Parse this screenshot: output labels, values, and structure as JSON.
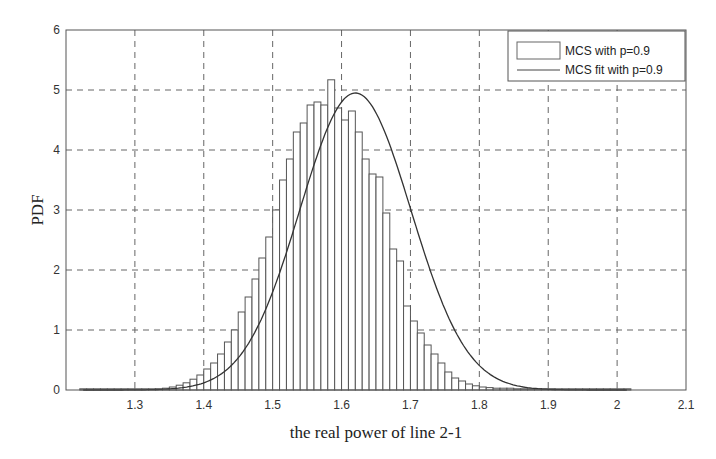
{
  "chart_data": {
    "type": "bar",
    "subtype": "histogram_with_fit",
    "title": "",
    "xlabel": "the real power of line 2-1",
    "ylabel": "PDF",
    "xlim": [
      1.2,
      2.1
    ],
    "ylim": [
      0,
      6
    ],
    "xticks": [
      "1.3",
      "1.4",
      "1.5",
      "1.6",
      "1.7",
      "1.8",
      "1.9",
      "2",
      "2.1"
    ],
    "xtick_values": [
      1.3,
      1.4,
      1.5,
      1.6,
      1.7,
      1.8,
      1.9,
      2.0,
      2.1
    ],
    "yticks": [
      "0",
      "1",
      "2",
      "3",
      "4",
      "5",
      "6"
    ],
    "ytick_values": [
      0,
      1,
      2,
      3,
      4,
      5,
      6
    ],
    "grid": true,
    "grid_style": "dashed",
    "legend_position": "upper right",
    "bin_width": 0.01,
    "series": [
      {
        "name": "MCS with p=0.9",
        "kind": "histogram",
        "bin_centers": [
          1.225,
          1.235,
          1.245,
          1.255,
          1.265,
          1.275,
          1.285,
          1.295,
          1.305,
          1.315,
          1.325,
          1.335,
          1.345,
          1.355,
          1.365,
          1.375,
          1.385,
          1.395,
          1.405,
          1.415,
          1.425,
          1.435,
          1.445,
          1.455,
          1.465,
          1.475,
          1.485,
          1.495,
          1.505,
          1.515,
          1.525,
          1.535,
          1.545,
          1.555,
          1.565,
          1.575,
          1.585,
          1.595,
          1.605,
          1.615,
          1.625,
          1.635,
          1.645,
          1.655,
          1.665,
          1.675,
          1.685,
          1.695,
          1.705,
          1.715,
          1.725,
          1.735,
          1.745,
          1.755,
          1.765,
          1.775,
          1.785,
          1.795,
          1.805,
          1.815,
          1.825,
          1.835,
          1.845,
          1.855,
          1.865,
          1.875,
          1.885,
          1.895,
          1.905,
          1.915,
          1.925,
          1.935,
          1.945,
          1.955,
          1.965,
          1.975,
          1.985,
          1.995,
          2.005,
          2.015
        ],
        "values": [
          0.02,
          0.02,
          0.02,
          0.02,
          0.02,
          0.02,
          0.02,
          0.02,
          0.02,
          0.02,
          0.02,
          0.02,
          0.03,
          0.05,
          0.08,
          0.12,
          0.18,
          0.25,
          0.35,
          0.45,
          0.6,
          0.8,
          1.0,
          1.3,
          1.55,
          1.85,
          2.2,
          2.55,
          3.0,
          3.5,
          3.85,
          4.3,
          4.45,
          4.75,
          4.8,
          4.75,
          5.17,
          4.7,
          4.5,
          4.65,
          4.3,
          3.85,
          3.6,
          3.55,
          2.95,
          2.35,
          2.15,
          1.4,
          1.15,
          0.95,
          0.75,
          0.6,
          0.45,
          0.3,
          0.2,
          0.15,
          0.1,
          0.07,
          0.05,
          0.04,
          0.03,
          0.03,
          0.03,
          0.02,
          0.02,
          0.02,
          0.02,
          0.02,
          0.02,
          0.02,
          0.02,
          0.02,
          0.02,
          0.02,
          0.02,
          0.02,
          0.02,
          0.02,
          0.02,
          0.02
        ],
        "color": "#ffffff",
        "edge_color": "#555555"
      },
      {
        "name": "MCS fit with p=0.9",
        "kind": "line",
        "distribution": "normal",
        "mean": 1.62,
        "std": 0.0806,
        "peak": 4.95,
        "color": "#333333"
      }
    ]
  },
  "legend": {
    "items": [
      {
        "label": "MCS with p=0.9",
        "symbol": "box"
      },
      {
        "label": "MCS fit with p=0.9",
        "symbol": "line"
      }
    ]
  }
}
